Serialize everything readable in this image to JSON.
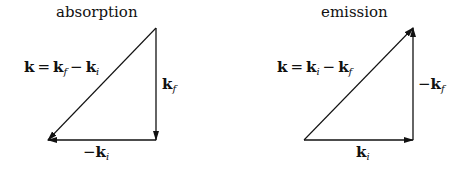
{
  "panels": {
    "absorption": {
      "title": "absorption",
      "diagonal_label": {
        "lhs": "k",
        "eq": "=",
        "a": "k",
        "a_sub": "f",
        "minus": "−",
        "b": "k",
        "b_sub": "i"
      },
      "vertical_label": {
        "prefix": "",
        "vec": "k",
        "sub": "f"
      },
      "horizontal_label": {
        "prefix": "−",
        "vec": "k",
        "sub": "i"
      },
      "vertices": {
        "top": [
          156,
          28
        ],
        "bottom_left": [
          48,
          140
        ],
        "bottom_right": [
          156,
          140
        ]
      },
      "arrows": [
        {
          "name": "kf",
          "from": "top",
          "to": "bottom_right",
          "direction": "down"
        },
        {
          "name": "-ki",
          "from": "bottom_right",
          "to": "bottom_left",
          "direction": "left"
        },
        {
          "name": "k",
          "from": "top",
          "to": "bottom_left",
          "direction": "down-left"
        }
      ]
    },
    "emission": {
      "title": "emission",
      "diagonal_label": {
        "lhs": "k",
        "eq": "=",
        "a": "k",
        "a_sub": "i",
        "minus": "−",
        "b": "k",
        "b_sub": "f"
      },
      "vertical_label": {
        "prefix": "−",
        "vec": "k",
        "sub": "f"
      },
      "horizontal_label": {
        "prefix": "",
        "vec": "k",
        "sub": "i"
      },
      "vertices": {
        "top": [
          413,
          28
        ],
        "bottom_left": [
          304,
          140
        ],
        "bottom_right": [
          413,
          140
        ]
      },
      "arrows": [
        {
          "name": "ki",
          "from": "bottom_left",
          "to": "bottom_right",
          "direction": "right"
        },
        {
          "name": "-kf",
          "from": "bottom_right",
          "to": "top",
          "direction": "up"
        },
        {
          "name": "k",
          "from": "bottom_left",
          "to": "top",
          "direction": "up-right"
        }
      ]
    }
  },
  "colors": {
    "stroke": "#111111",
    "background": "#ffffff"
  }
}
